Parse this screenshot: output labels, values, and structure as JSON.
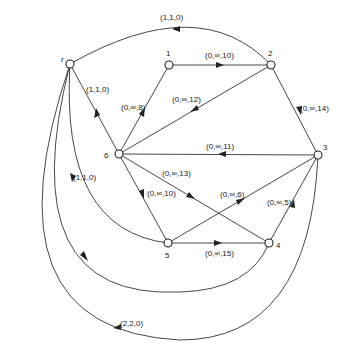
{
  "diagram": {
    "type": "directed network flow graph",
    "nodes": [
      {
        "id": "r",
        "label": "r",
        "x": 70,
        "y": 64
      },
      {
        "id": "1",
        "label": "1",
        "x": 169,
        "y": 65
      },
      {
        "id": "2",
        "label": "2",
        "x": 271,
        "y": 65
      },
      {
        "id": "3",
        "label": "3",
        "x": 318,
        "y": 155
      },
      {
        "id": "4",
        "label": "4",
        "x": 269,
        "y": 243
      },
      {
        "id": "5",
        "label": "5",
        "x": 168,
        "y": 243
      },
      {
        "id": "6",
        "label": "6",
        "x": 119,
        "y": 154
      }
    ],
    "edges": [
      {
        "from": "2",
        "to": "r",
        "label": "(1,1,0)"
      },
      {
        "from": "1",
        "to": "2",
        "label": "(0,∞,10)"
      },
      {
        "from": "2",
        "to": "3",
        "label": "(0,∞,14)"
      },
      {
        "from": "6",
        "to": "r",
        "label": "(1,1,0)"
      },
      {
        "from": "6",
        "to": "1",
        "label": "(0,∞,8)"
      },
      {
        "from": "2",
        "to": "6",
        "label": "(0,∞,12)"
      },
      {
        "from": "3",
        "to": "6",
        "label": "(0,∞,11)"
      },
      {
        "from": "6",
        "to": "4",
        "label": "(0,∞,13)"
      },
      {
        "from": "6",
        "to": "5",
        "label": "(0,∞,10)"
      },
      {
        "from": "5",
        "to": "3",
        "label": "(0,∞,6)"
      },
      {
        "from": "4",
        "to": "3",
        "label": "(0,∞,5)"
      },
      {
        "from": "5",
        "to": "4",
        "label": "(0,∞,15)"
      },
      {
        "from": "5",
        "to": "r",
        "label": "(1,1,0)"
      },
      {
        "from": "r",
        "to": "4",
        "label": ""
      },
      {
        "from": "3",
        "to": "r",
        "label": "(2,2,0)"
      }
    ]
  }
}
